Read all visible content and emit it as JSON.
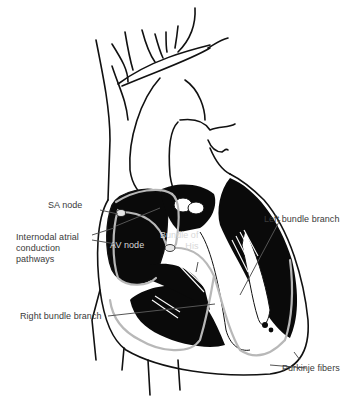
{
  "diagram": {
    "colors": {
      "background": "#ffffff",
      "outline": "#111111",
      "chamber_fill": "#0a0a0a",
      "conduction_path": "#b8b8b8",
      "label_text": "#3a3a3a",
      "label_text_inverse": "#d8d8d8",
      "leader_line": "#555555"
    },
    "labels": {
      "sa_node": "SA node",
      "internodal": "Internodal atrial\nconduction\npathways",
      "av_node": "AV node",
      "bundle_of_his": "Bundle of\nHis",
      "left_bundle_branch": "Left bundle branch",
      "right_bundle_branch": "Right bundle branch",
      "purkinje_fibers": "Purkinje fibers"
    }
  }
}
